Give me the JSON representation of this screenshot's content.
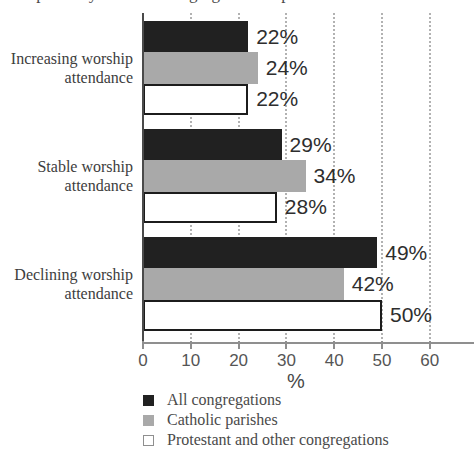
{
  "clipped_header": {
    "text": "compared by whether congregations report"
  },
  "chart_data": {
    "type": "bar",
    "orientation": "horizontal",
    "title": "",
    "xlabel": "%",
    "xticks": [
      0,
      10,
      20,
      30,
      40,
      50,
      60
    ],
    "xlim": [
      0,
      69
    ],
    "grid": "dotted-vertical",
    "legend_position": "bottom-left",
    "categories": [
      "Increasing worship attendance",
      "Stable worship attendance",
      "Declining worship attendance"
    ],
    "category_lines": [
      [
        "Increasing worship",
        "attendance"
      ],
      [
        "Stable worship",
        "attendance"
      ],
      [
        "Declining worship",
        "attendance"
      ]
    ],
    "series": [
      {
        "name": "All congregations",
        "color": "#212121",
        "values": [
          22,
          29,
          49
        ]
      },
      {
        "name": "Catholic parishes",
        "color": "#a9a9a9",
        "values": [
          24,
          34,
          42
        ]
      },
      {
        "name": "Protestant and other congregations",
        "color": "#ffffff",
        "values": [
          22,
          28,
          50
        ]
      }
    ],
    "value_suffix": "%"
  },
  "colors": {
    "bar_black": "#212121",
    "bar_gray": "#a9a9a9",
    "bar_white": "#ffffff",
    "bar_border": "#1c1c1c",
    "axis": "#8f8f8f",
    "gridline": "#b2b2b2",
    "label_text": "#3d3d3d",
    "value_text": "#2e2e2e"
  }
}
